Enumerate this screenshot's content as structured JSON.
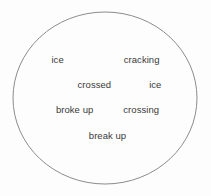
{
  "figure": {
    "type": "word-bubble-diagram",
    "background_color": "#fdfdfd",
    "shape": {
      "name": "ellipse",
      "stroke_color": "#8c8c8c",
      "fill_color": "none",
      "stroke_width": 1,
      "center_x": 105,
      "center_y": 98,
      "radius_x": 92,
      "radius_y": 86
    },
    "text_color": "#3a3a3a",
    "rows": [
      {
        "row_index": 0,
        "words": [
          {
            "text": "ice"
          },
          {
            "text": "cracking"
          }
        ]
      },
      {
        "row_index": 1,
        "words": [
          {
            "text": "crossed"
          },
          {
            "text": "ice"
          }
        ]
      },
      {
        "row_index": 2,
        "words": [
          {
            "text": "broke up"
          },
          {
            "text": "crossing"
          }
        ]
      },
      {
        "row_index": 3,
        "words": [
          {
            "text": "break up"
          }
        ]
      }
    ]
  }
}
